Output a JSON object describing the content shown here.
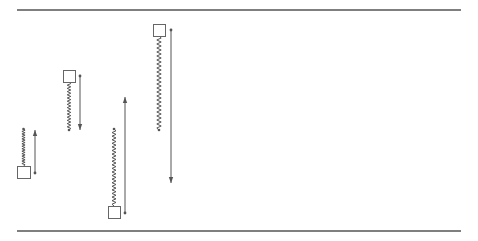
{
  "diagram": {
    "title": "",
    "colors": {
      "background": "#ffffff",
      "line": "#555555",
      "box_stroke": "#666666",
      "spring": "#555555",
      "arrow": "#555555"
    },
    "boundaries": [
      {
        "name": "top-boundary",
        "x1": 17,
        "x2": 461,
        "y": 10
      },
      {
        "name": "bottom-boundary",
        "x1": 17,
        "x2": 461,
        "y": 231
      }
    ],
    "systems": [
      {
        "id": 1,
        "box": {
          "x": 17,
          "y": 166,
          "w": 13,
          "h": 12
        },
        "spring": {
          "x": 23.5,
          "y1": 129,
          "y2": 166,
          "period": 2.5,
          "amplitude": 1.6
        },
        "arrow": {
          "x": 35,
          "y_from": 173,
          "y_to": 130,
          "direction": "up"
        }
      },
      {
        "id": 2,
        "box": {
          "x": 63,
          "y": 70,
          "w": 12,
          "h": 12
        },
        "spring": {
          "x": 69,
          "y1": 82,
          "y2": 130,
          "period": 3.2,
          "amplitude": 1.8
        },
        "arrow": {
          "x": 80,
          "y_from": 76,
          "y_to": 130,
          "direction": "down"
        }
      },
      {
        "id": 3,
        "box": {
          "x": 108,
          "y": 206,
          "w": 12,
          "h": 12
        },
        "spring": {
          "x": 114,
          "y1": 129,
          "y2": 206,
          "period": 3.6,
          "amplitude": 2.0
        },
        "arrow": {
          "x": 125,
          "y_from": 213,
          "y_to": 97,
          "direction": "up"
        }
      },
      {
        "id": 4,
        "box": {
          "x": 153,
          "y": 24,
          "w": 12,
          "h": 12
        },
        "spring": {
          "x": 159,
          "y1": 36,
          "y2": 130,
          "period": 4.0,
          "amplitude": 2.2
        },
        "arrow": {
          "x": 171,
          "y_from": 30,
          "y_to": 183,
          "direction": "down"
        }
      }
    ]
  }
}
